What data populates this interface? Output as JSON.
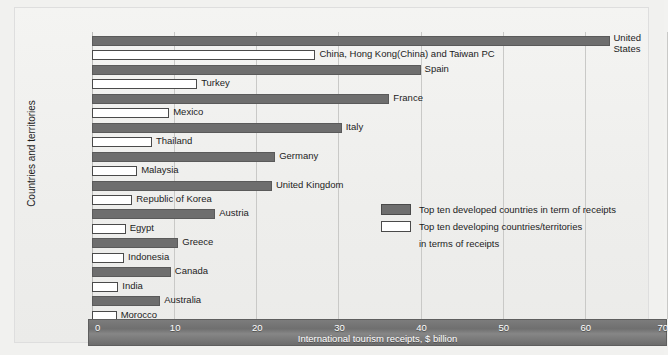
{
  "chart_data": {
    "type": "bar",
    "orientation": "horizontal",
    "title": "",
    "xlabel": "International tourism receipts, $ billion",
    "ylabel": "Countries and territories",
    "xlim": [
      0,
      70
    ],
    "xticks": [
      "0",
      "10",
      "20",
      "30",
      "40",
      "50",
      "60",
      "70"
    ],
    "xtick_values": [
      0,
      10,
      20,
      30,
      40,
      50,
      60,
      70
    ],
    "grid": true,
    "legend_position": "middle-right",
    "series": [
      {
        "name": "Top ten developed countries in term of receipts",
        "key": "developed"
      },
      {
        "name": "Top ten developing countries/territories in terms of receipts",
        "key": "developing"
      }
    ],
    "bars": [
      {
        "label": "United States",
        "value": 63.0,
        "series": "developed",
        "label_lines": [
          "United",
          "States"
        ]
      },
      {
        "label": "China, Hong Kong(China) and Taiwan PC",
        "value": 27.2,
        "series": "developing"
      },
      {
        "label": "Spain",
        "value": 40.0,
        "series": "developed"
      },
      {
        "label": "Turkey",
        "value": 12.8,
        "series": "developing"
      },
      {
        "label": "France",
        "value": 36.2,
        "series": "developed"
      },
      {
        "label": "Mexico",
        "value": 9.4,
        "series": "developing"
      },
      {
        "label": "Italy",
        "value": 30.4,
        "series": "developed"
      },
      {
        "label": "Thailand",
        "value": 7.3,
        "series": "developing"
      },
      {
        "label": "Germany",
        "value": 22.3,
        "series": "developed"
      },
      {
        "label": "Malaysia",
        "value": 5.5,
        "series": "developing"
      },
      {
        "label": "United Kingdom",
        "value": 21.9,
        "series": "developed"
      },
      {
        "label": "Republic of Korea",
        "value": 4.9,
        "series": "developing"
      },
      {
        "label": "Austria",
        "value": 15.0,
        "series": "developed"
      },
      {
        "label": "Egypt",
        "value": 4.1,
        "series": "developing"
      },
      {
        "label": "Greece",
        "value": 10.5,
        "series": "developed"
      },
      {
        "label": "Indonesia",
        "value": 3.9,
        "series": "developing"
      },
      {
        "label": "Canada",
        "value": 9.6,
        "series": "developed"
      },
      {
        "label": "India",
        "value": 3.2,
        "series": "developing"
      },
      {
        "label": "Australia",
        "value": 8.3,
        "series": "developed"
      },
      {
        "label": "Morocco",
        "value": 3.0,
        "series": "developing"
      }
    ]
  },
  "legend": {
    "items": [
      {
        "swatch": "developed",
        "lines": [
          "Top ten developed countries in term of receipts"
        ]
      },
      {
        "swatch": "developing",
        "lines": [
          "Top ten developing countries/territories",
          "in terms of receipts"
        ]
      }
    ]
  },
  "colors": {
    "developed": "#6e6e6e",
    "developing": "#ffffff",
    "axis_band": "#757575",
    "grid": "#c9c9c7",
    "background": "#f1f1ef",
    "text": "#1c1c1c"
  }
}
